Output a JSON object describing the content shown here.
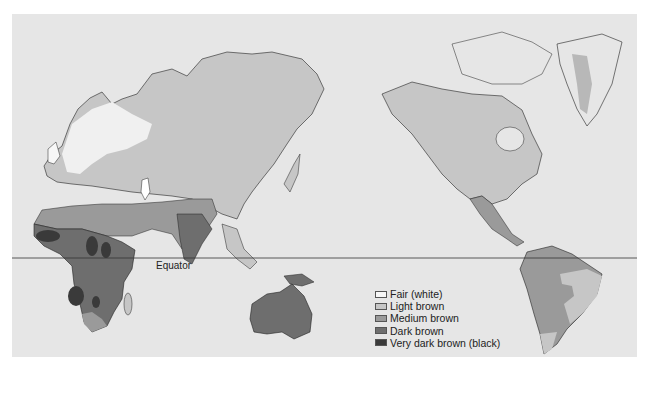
{
  "map": {
    "subject": "Global distribution of human skin color",
    "equator_label": "Equator",
    "legend": [
      {
        "label": "Fair (white)",
        "color": "#f7f7f7"
      },
      {
        "label": "Light brown",
        "color": "#c6c6c6"
      },
      {
        "label": "Medium brown",
        "color": "#9a9a9a"
      },
      {
        "label": "Dark brown",
        "color": "#6e6e6e"
      },
      {
        "label": "Very dark brown (black)",
        "color": "#3a3a3a"
      }
    ],
    "colors": {
      "ocean": "#e6e6e6",
      "land_light": "#c6c6c6",
      "land_fair": "#f7f7f7",
      "medium": "#9a9a9a",
      "dark": "#6e6e6e",
      "very_dark": "#3a3a3a",
      "outline": "#222222"
    }
  }
}
